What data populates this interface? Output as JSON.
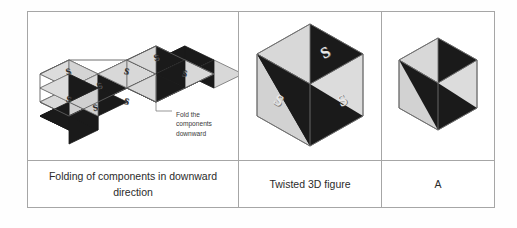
{
  "figure": {
    "columns": [
      {
        "id": "net",
        "caption": "Folding of components in downward direction",
        "annotation": {
          "line1": "Fold the",
          "line2": "components",
          "line3": "downward"
        },
        "face_symbol": "S",
        "face_symbol_count": 8
      },
      {
        "id": "twisted",
        "caption": "Twisted 3D figure",
        "face_symbol": "S",
        "face_symbol_count": 3
      },
      {
        "id": "answer",
        "caption": "A",
        "face_symbol": "",
        "face_symbol_count": 0
      }
    ],
    "colors": {
      "dark_face": "#1a1a1a",
      "light_face": "#d8d8d8",
      "mid_face": "#c2c2c2",
      "edge": "#6f6f6f",
      "table_border": "#a6a6a6",
      "background": "#ffffff",
      "text": "#2b2b2b",
      "annotation_text": "#3a3a3a"
    }
  }
}
